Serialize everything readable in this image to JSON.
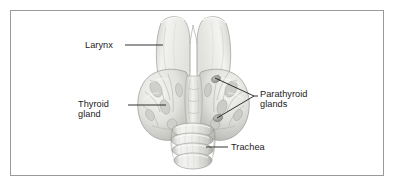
{
  "figure": {
    "background_color": "#ffffff",
    "border_color": "#9a9a9a",
    "text_color": "#1b1b1b",
    "leader_line_color": "#1b1b1b",
    "tissue_light": "#f4f4f2",
    "tissue_mid": "#dcdcd8",
    "tissue_shadow": "#b6b6b2",
    "tissue_dark": "#8f8f8c"
  },
  "labels": [
    {
      "id": "larynx",
      "name": "Larynx",
      "lines": [
        "Larynx"
      ],
      "align": "right-of-text",
      "text_x": 85,
      "text_y": 40,
      "leader": {
        "type": "line",
        "x1": 125,
        "y1": 45,
        "x2": 163,
        "y2": 45
      }
    },
    {
      "id": "thyroid-gland",
      "name": "Thyroid gland",
      "lines": [
        "Thyroid",
        "gland"
      ],
      "align": "right-of-text",
      "text_x": 78,
      "text_y": 99,
      "leader": {
        "type": "line",
        "x1": 128,
        "y1": 105,
        "x2": 166,
        "y2": 105
      }
    },
    {
      "id": "parathyroid-glands",
      "name": "Parathyroid glands",
      "lines": [
        "Parathyroid",
        "glands"
      ],
      "align": "left-of-text",
      "text_x": 260,
      "text_y": 89,
      "leader": {
        "type": "fork",
        "junction_x": 254,
        "junction_y": 96,
        "branches": [
          {
            "x": 215,
            "y": 78
          },
          {
            "x": 217,
            "y": 118
          }
        ]
      }
    },
    {
      "id": "trachea",
      "name": "Trachea",
      "lines": [
        "Trachea"
      ],
      "align": "left-of-text",
      "text_x": 231,
      "text_y": 142,
      "leader": {
        "type": "line",
        "x1": 206,
        "y1": 147,
        "x2": 228,
        "y2": 147
      }
    }
  ],
  "anatomy": {
    "larynx": {
      "label": "Larynx",
      "part": "thyroid cartilage with superior notch",
      "center_x": 193,
      "top_y": 16
    },
    "thyroid_gland": {
      "label": "Thyroid gland",
      "lobes": [
        "left lobe",
        "right lobe"
      ],
      "isthmus": true,
      "center_x": 193,
      "center_y": 97
    },
    "parathyroid_glands": {
      "label": "Parathyroid glands",
      "count_visible": 2,
      "positions": [
        {
          "x": 216,
          "y": 79
        },
        {
          "x": 218,
          "y": 118
        }
      ]
    },
    "trachea": {
      "label": "Trachea",
      "cartilage_rings_visible": 4,
      "center_x": 192,
      "top_y": 128
    }
  }
}
